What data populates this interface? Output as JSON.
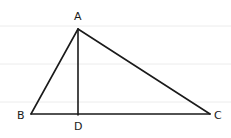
{
  "diagram": {
    "type": "geometry",
    "points": {
      "A": {
        "label": "A",
        "x": 78,
        "y": 29
      },
      "B": {
        "label": "B",
        "x": 31,
        "y": 114
      },
      "C": {
        "label": "C",
        "x": 210,
        "y": 114
      },
      "D": {
        "label": "D",
        "x": 78,
        "y": 115
      }
    },
    "segments": [
      {
        "from": "A",
        "to": "B"
      },
      {
        "from": "A",
        "to": "C"
      },
      {
        "from": "B",
        "to": "C"
      },
      {
        "from": "A",
        "to": "D"
      }
    ],
    "labels": {
      "A": "A",
      "B": "B",
      "C": "C",
      "D": "D"
    },
    "colors": {
      "stroke": "#1a1a1a",
      "ruled_lines": "#e8e8e8",
      "background": "#ffffff"
    }
  }
}
